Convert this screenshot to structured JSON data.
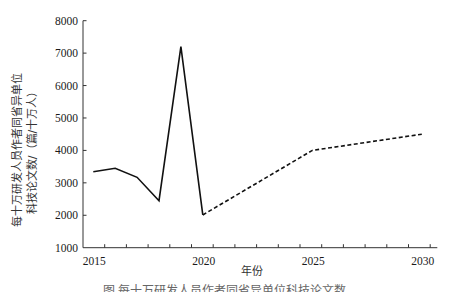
{
  "chart_data": {
    "type": "line",
    "title": "",
    "xlabel": "年份",
    "ylabel": [
      "每十万研发人员作者同省异单位",
      "科技论文数/（篇/十万人）"
    ],
    "xlim": [
      2014.55,
      2030.7
    ],
    "ylim": [
      1000,
      8000
    ],
    "grid": false,
    "legend": null,
    "x_ticks": [
      2015,
      2020,
      2025,
      2030
    ],
    "y_ticks": [
      1000,
      2000,
      3000,
      4000,
      5000,
      6000,
      7000,
      8000
    ],
    "series": [
      {
        "name": "historical",
        "style": "solid",
        "x": [
          2015,
          2016,
          2017,
          2018,
          2019,
          2020
        ],
        "values": [
          3340,
          3450,
          3170,
          2450,
          7200,
          2010
        ]
      },
      {
        "name": "projected",
        "style": "dashed",
        "x": [
          2020,
          2025,
          2030
        ],
        "values": [
          2010,
          4000,
          4500
        ]
      }
    ]
  },
  "axes": {
    "x_label": "年份",
    "y_label_line1": "每十万研发人员作者同省异单位",
    "y_label_line2": "科技论文数/（篇/十万人）",
    "x_tick_labels": [
      "2015",
      "2020",
      "2025",
      "2030"
    ],
    "y_tick_labels": [
      "8000",
      "7000",
      "6000",
      "5000",
      "4000",
      "3000",
      "2000",
      "1000"
    ]
  },
  "caption": "图  每十万研发人员作者同省异单位科技论文数"
}
